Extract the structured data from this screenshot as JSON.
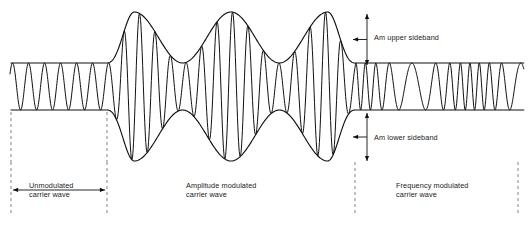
{
  "figure": {
    "stroke_color": "#111111",
    "background_color": "#ffffff",
    "dash_color": "#777777"
  },
  "annotations": {
    "upper_sideband": "Am upper sideband",
    "lower_sideband": "Am lower sideband",
    "section_unmodulated": "Unmodulated\ncarrier wave",
    "section_am": "Amplitude modulated\ncarrier wave",
    "section_fm": "Frequency modulated\ncarrier wave"
  },
  "chart_data": {
    "type": "line",
    "xlabel": "",
    "ylabel": "",
    "xlim": [
      0,
      530
    ],
    "ylim": [
      0,
      226
    ],
    "grid": false,
    "legend": "none",
    "axis_center_y": 86.5,
    "sections": [
      {
        "name": "unmodulated-carrier-wave",
        "x_start": 11,
        "x_end": 107,
        "envelope_top": 63,
        "envelope_bottom": 110,
        "amplitude": 23.5,
        "carrier_cycles": 6,
        "modulation": "none"
      },
      {
        "name": "amplitude-modulated-carrier-wave",
        "x_start": 107,
        "x_end": 355,
        "envelope_peak_top": 12,
        "envelope_peak_bottom": 161,
        "envelope_cycles": 2,
        "carrier_cycles": 16,
        "modulation": "amplitude"
      },
      {
        "name": "frequency-modulated-carrier-wave",
        "x_start": 355,
        "x_end": 524,
        "envelope_top": 63,
        "envelope_bottom": 110,
        "amplitude": 23.5,
        "carrier_cycles": 12,
        "modulation": "frequency"
      }
    ],
    "dashed_boundaries": [
      11,
      107,
      355,
      518
    ],
    "measure_arrows": [
      {
        "name": "am-upper-sideband",
        "x": 367,
        "y_top": 14,
        "y_bottom": 65
      },
      {
        "name": "am-lower-sideband",
        "x": 367,
        "y_top": 113,
        "y_bottom": 161
      }
    ],
    "span_arrow": {
      "name": "unmodulated-span",
      "y": 190,
      "x_start": 13,
      "x_end": 105
    }
  }
}
